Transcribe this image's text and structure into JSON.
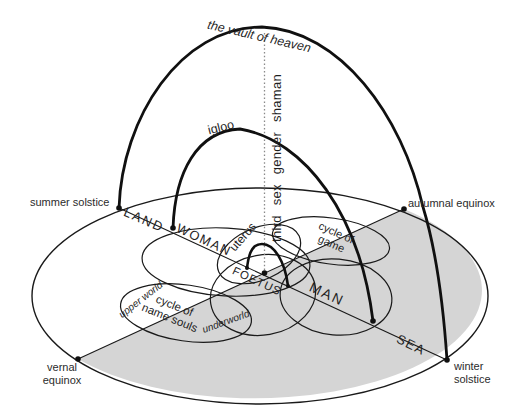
{
  "labels": {
    "vault": "the vault of heaven",
    "igloo": "igloo",
    "axis_vertical": "third sex gender shaman",
    "summer": "summer solstice",
    "autumnal": "autumnal equinox",
    "vernal": "vernal equinox",
    "winter": "winter solstice",
    "land": "LAND",
    "sea": "SEA",
    "woman": "WOMAN",
    "man": "MAN",
    "uterus": "uterus",
    "foetus": "FOETUS",
    "cycle_of_game": "cycle of game",
    "cycle_of_name_souls": "cycle of name souls",
    "upper_world": "upper world",
    "underworld": "underworld"
  },
  "colors": {
    "sea_fill": "#d5d5d5",
    "line": "#1a1a1a",
    "dotted_line": "#8a8a8a",
    "text": "#1f1f1f"
  }
}
